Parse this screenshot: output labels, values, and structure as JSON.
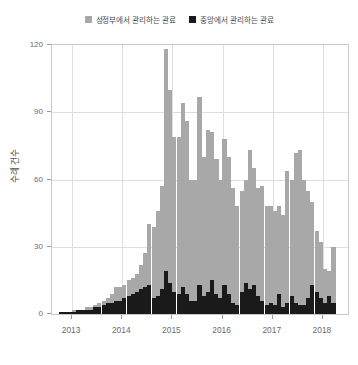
{
  "legend": {
    "position": "top-center",
    "entries": [
      {
        "label": "성정부에서 관리하는 관료",
        "color": "#a8a8a8",
        "swatch_name": "legend-swatch-gray"
      },
      {
        "label": "중앙에서 관리하는 관료",
        "color": "#1a1a1a",
        "swatch_name": "legend-swatch-black"
      }
    ]
  },
  "chart_data": {
    "type": "bar",
    "stacked": true,
    "title": "",
    "subtitle": "",
    "xlabel": "",
    "ylabel": "수례 건수",
    "ylim": [
      0,
      120
    ],
    "yticks": [
      0,
      30,
      60,
      90,
      120
    ],
    "xlim": [
      2012.6,
      2018.5
    ],
    "xticks": [
      2013,
      2014,
      2015,
      2016,
      2017,
      2018
    ],
    "xticklabels": [
      "2013",
      "2014",
      "2015",
      "2016",
      "2017",
      "2018"
    ],
    "grid": true,
    "grid_axis": "both",
    "legend_position": "top-center",
    "x": [
      2012.79,
      2012.88,
      2012.96,
      2013.04,
      2013.13,
      2013.21,
      2013.29,
      2013.38,
      2013.46,
      2013.54,
      2013.63,
      2013.71,
      2013.79,
      2013.88,
      2013.96,
      2014.04,
      2014.13,
      2014.21,
      2014.29,
      2014.38,
      2014.46,
      2014.54,
      2014.63,
      2014.71,
      2014.79,
      2014.88,
      2014.96,
      2015.04,
      2015.13,
      2015.21,
      2015.29,
      2015.38,
      2015.46,
      2015.54,
      2015.63,
      2015.71,
      2015.79,
      2015.88,
      2015.96,
      2016.04,
      2016.13,
      2016.21,
      2016.29,
      2016.38,
      2016.46,
      2016.54,
      2016.63,
      2016.71,
      2016.79,
      2016.88,
      2016.96,
      2017.04,
      2017.13,
      2017.21,
      2017.29,
      2017.38,
      2017.46,
      2017.54,
      2017.63,
      2017.71,
      2017.79,
      2017.88,
      2017.96,
      2018.04,
      2018.13,
      2018.21
    ],
    "series": [
      {
        "name": "성정부에서 관리하는 관료",
        "color": "#a8a8a8",
        "stack_order": "top",
        "values": [
          1,
          1,
          1,
          2,
          2,
          2,
          3,
          3,
          4,
          5,
          6,
          7,
          9,
          12,
          12,
          13,
          15,
          16,
          18,
          22,
          27,
          40,
          39,
          46,
          57,
          118,
          100,
          79,
          79,
          94,
          86,
          60,
          60,
          97,
          70,
          82,
          81,
          69,
          60,
          78,
          70,
          56,
          48,
          55,
          60,
          73,
          65,
          56,
          57,
          48,
          48,
          46,
          48,
          44,
          64,
          60,
          72,
          73,
          60,
          55,
          50,
          37,
          32,
          20,
          19,
          30
        ]
      },
      {
        "name": "중앙에서 관리하는 관료",
        "color": "#1a1a1a",
        "stack_order": "bottom",
        "values": [
          1,
          1,
          1,
          1,
          2,
          2,
          2,
          2,
          3,
          3,
          4,
          5,
          5,
          6,
          6,
          7,
          8,
          9,
          10,
          11,
          12,
          13,
          7,
          8,
          11,
          19,
          14,
          10,
          9,
          12,
          9,
          6,
          6,
          13,
          8,
          10,
          15,
          9,
          7,
          13,
          9,
          5,
          4,
          10,
          14,
          11,
          13,
          8,
          6,
          4,
          5,
          4,
          9,
          3,
          5,
          8,
          5,
          4,
          4,
          7,
          13,
          10,
          7,
          5,
          8,
          5
        ]
      }
    ]
  }
}
